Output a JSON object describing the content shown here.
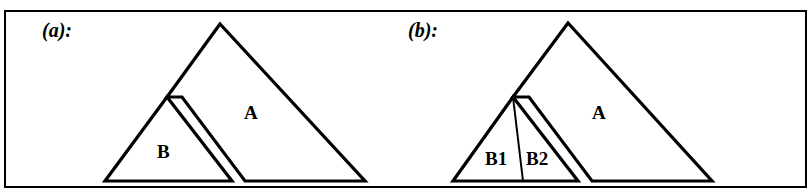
{
  "figure": {
    "type": "linguistic-syntax-triangle-diagram",
    "border_color": "#000000",
    "line_color": "#000000",
    "background_color": "#ffffff",
    "panels": [
      {
        "id": "a",
        "caption": "(a):",
        "labels": {
          "big_triangle": "A",
          "small_triangle": "B"
        }
      },
      {
        "id": "b",
        "caption": "(b):",
        "labels": {
          "big_triangle": "A",
          "small_triangle_left": "B1",
          "small_triangle_right": "B2"
        }
      }
    ]
  },
  "geometry": {
    "panel_a": {
      "triangle_A": "M 220,24 L 167,97 L 182,97 L 245,181 L 365,181 Z",
      "triangle_B": "M 167,97 L 105,181 L 232,181 Z"
    },
    "panel_b": {
      "triangle_A": "M 568,23 L 513,97 L 529,97 L 592,181 L 712,181 Z",
      "triangle_B": "M 513,97 L 453,181 L 578,181 Z",
      "divider_B1_B2": "M 513,97 L 523,181"
    }
  }
}
